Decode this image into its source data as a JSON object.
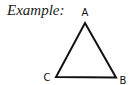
{
  "heading": {
    "label": "Example:"
  },
  "triangle": {
    "shape": "equilateral-triangle",
    "stroke_color": "#111111",
    "vertices": [
      {
        "name": "A",
        "position": "top"
      },
      {
        "name": "B",
        "position": "bottom-right"
      },
      {
        "name": "C",
        "position": "bottom-left"
      }
    ]
  }
}
